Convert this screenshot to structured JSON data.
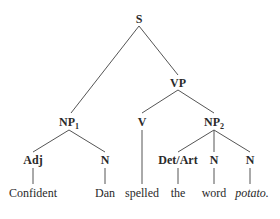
{
  "diagram": {
    "type": "syntax-tree",
    "sentence": "Confident Dan spelled the word potato.",
    "nodes": {
      "S": {
        "label": "S"
      },
      "VP": {
        "label": "VP"
      },
      "NP1": {
        "label": "NP",
        "sub": "1"
      },
      "V": {
        "label": "V"
      },
      "NP2": {
        "label": "NP",
        "sub": "2"
      },
      "Adj": {
        "label": "Adj"
      },
      "N1": {
        "label": "N"
      },
      "DetArt": {
        "label": "Det/Art"
      },
      "N2": {
        "label": "N"
      },
      "N3": {
        "label": "N"
      }
    },
    "leaves": {
      "confident": "Confident",
      "dan": "Dan",
      "spelled": "spelled",
      "the": "the",
      "word": "word",
      "potato": "potato."
    },
    "edges": [
      [
        "S",
        "NP1"
      ],
      [
        "S",
        "VP"
      ],
      [
        "VP",
        "V"
      ],
      [
        "VP",
        "NP2"
      ],
      [
        "NP1",
        "Adj"
      ],
      [
        "NP1",
        "N1"
      ],
      [
        "NP2",
        "DetArt"
      ],
      [
        "NP2",
        "N2"
      ],
      [
        "NP2",
        "N3"
      ],
      [
        "Adj",
        "confident"
      ],
      [
        "N1",
        "dan"
      ],
      [
        "V",
        "spelled"
      ],
      [
        "DetArt",
        "the"
      ],
      [
        "N2",
        "word"
      ],
      [
        "N3",
        "potato"
      ]
    ]
  }
}
